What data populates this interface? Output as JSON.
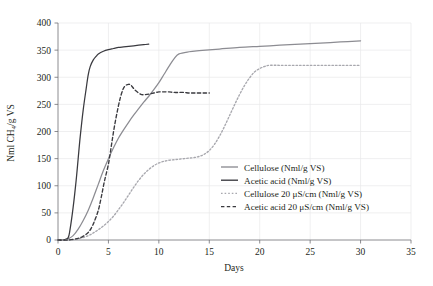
{
  "chart_data": {
    "type": "line",
    "title": "",
    "xlabel": "Days",
    "ylabel": "Nml CH4/g VS",
    "ylabel_display": "Nml CH₄/g VS",
    "xlim": [
      0,
      35
    ],
    "ylim": [
      0,
      400
    ],
    "xticks": [
      0,
      5,
      10,
      15,
      20,
      25,
      30,
      35
    ],
    "yticks": [
      0,
      50,
      100,
      150,
      200,
      250,
      300,
      350,
      400
    ],
    "grid": true,
    "legend_position": "center-right",
    "series": [
      {
        "name": "Cellulose (Nml/g VS)",
        "style": "solid",
        "color": "#8c8c92",
        "x": [
          0,
          0.5,
          1,
          1.5,
          2,
          2.5,
          3,
          3.5,
          4,
          4.5,
          5,
          5.5,
          6,
          6.5,
          7,
          7.5,
          8,
          8.5,
          9,
          9.5,
          10,
          10.5,
          11,
          11.5,
          12,
          13,
          14,
          16,
          18,
          20,
          22,
          24,
          26,
          28,
          30
        ],
        "y": [
          0,
          0,
          2,
          8,
          20,
          36,
          55,
          78,
          103,
          128,
          150,
          170,
          188,
          203,
          217,
          230,
          242,
          254,
          265,
          277,
          290,
          305,
          320,
          334,
          343,
          347,
          349,
          352,
          355,
          357,
          359,
          361,
          363,
          365,
          367
        ]
      },
      {
        "name": "Acetic acid (Nml/g VS)",
        "style": "solid",
        "color": "#3a3a3f",
        "x": [
          0,
          0.5,
          1,
          1.2,
          1.5,
          1.8,
          2,
          2.2,
          2.5,
          2.8,
          3,
          3.2,
          3.5,
          3.8,
          4,
          4.5,
          5,
          5.5,
          6,
          6.5,
          7,
          7.5,
          8,
          8.5,
          9
        ],
        "y": [
          0,
          0,
          4,
          20,
          60,
          110,
          150,
          190,
          240,
          280,
          305,
          320,
          332,
          339,
          343,
          348,
          351,
          353,
          355,
          356,
          357,
          358,
          359,
          360,
          361
        ]
      },
      {
        "name": "Cellulose 20 μS/cm (Nml/g VS)",
        "style": "dotted",
        "color": "#a8a8ae",
        "x": [
          0,
          1,
          2,
          3,
          3.5,
          4,
          4.5,
          5,
          5.5,
          6,
          6.5,
          7,
          7.5,
          8,
          8.5,
          9,
          9.5,
          10,
          10.5,
          11,
          11.5,
          12,
          12.5,
          13,
          13.5,
          14,
          14.5,
          15,
          15.5,
          16,
          16.5,
          17,
          17.5,
          18,
          18.5,
          19,
          19.5,
          20,
          20.5,
          21,
          22,
          24,
          26,
          28,
          30
        ],
        "y": [
          0,
          0,
          2,
          8,
          13,
          19,
          26,
          34,
          44,
          56,
          69,
          83,
          97,
          110,
          121,
          130,
          137,
          142,
          145,
          147,
          148,
          149,
          150,
          151,
          152,
          154,
          158,
          165,
          176,
          191,
          209,
          229,
          249,
          268,
          285,
          299,
          310,
          316,
          320,
          322,
          322,
          322,
          322,
          322,
          322
        ]
      },
      {
        "name": "Acetic acid 20 μS/cm (Nml/g VS)",
        "style": "dashed",
        "color": "#3a3a3f",
        "x": [
          0,
          1,
          2,
          2.5,
          3,
          3.3,
          3.6,
          4,
          4.3,
          4.6,
          5,
          5.3,
          5.6,
          6,
          6.3,
          6.6,
          7,
          7.3,
          7.6,
          8,
          8.3,
          8.6,
          9,
          9.5,
          10,
          10.5,
          11,
          11.5,
          12,
          12.5,
          13,
          13.5,
          14,
          14.5,
          15
        ],
        "y": [
          0,
          0,
          3,
          7,
          14,
          22,
          34,
          55,
          80,
          108,
          140,
          175,
          210,
          248,
          270,
          283,
          287,
          284,
          277,
          271,
          268,
          268,
          269,
          271,
          273,
          273,
          273,
          272,
          272,
          272,
          271,
          271,
          271,
          271,
          271
        ]
      }
    ]
  },
  "axes": {
    "ylabel": "Nml CH₄/g VS",
    "xlabel": "Days",
    "ytick_labels": [
      "400",
      "350",
      "300",
      "250",
      "200",
      "150",
      "100",
      "50",
      "0"
    ],
    "xtick_labels": [
      "0",
      "5",
      "10",
      "15",
      "20",
      "25",
      "30",
      "35"
    ]
  },
  "legend": {
    "items": [
      {
        "label": "Cellulose (Nml/g VS)",
        "style": "solid",
        "color": "#8c8c92"
      },
      {
        "label": "Acetic acid (Nml/g VS)",
        "style": "solid",
        "color": "#3a3a3f"
      },
      {
        "label": "Cellulose 20 μS/cm (Nml/g VS)",
        "style": "dotted",
        "color": "#a8a8ae"
      },
      {
        "label": "Acetic acid 20 μS/cm (Nml/g VS)",
        "style": "dashed",
        "color": "#3a3a3f"
      }
    ]
  }
}
